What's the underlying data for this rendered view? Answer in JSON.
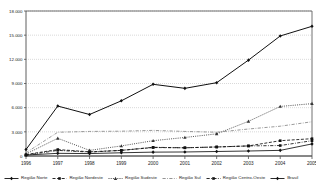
{
  "chart_data": {
    "type": "line",
    "title": "",
    "xlabel": "",
    "ylabel": "",
    "grid": true,
    "legend_position": "bottom",
    "ylim": [
      0,
      18000
    ],
    "yticks": [
      0,
      3000,
      6000,
      9000,
      12000,
      15000,
      18000
    ],
    "ytick_labels": [
      "0",
      "3.000",
      "6.000",
      "9.000",
      "12.000",
      "15.000",
      "18.000"
    ],
    "categories": [
      "1996",
      "1997",
      "1998",
      "1999",
      "2000",
      "2001",
      "2002",
      "2003",
      "2004",
      "2005"
    ],
    "series": [
      {
        "name": "Região Norte",
        "color": "#111111",
        "dash": "solid",
        "marker": "diamond",
        "values": [
          120,
          330,
          300,
          400,
          480,
          500,
          560,
          620,
          700,
          1500
        ]
      },
      {
        "name": "Região Nordeste",
        "color": "#111111",
        "dash": "dashed",
        "marker": "square",
        "values": [
          180,
          800,
          520,
          700,
          1050,
          1020,
          1120,
          1250,
          1900,
          2150
        ]
      },
      {
        "name": "Região Sudeste",
        "color": "#333333",
        "dash": "dotted",
        "marker": "triangle",
        "values": [
          250,
          2200,
          700,
          1250,
          1900,
          2300,
          2750,
          4300,
          6150,
          6500
        ]
      },
      {
        "name": "Região Sul",
        "color": "#888888",
        "dash": "dashdot",
        "marker": "none",
        "values": [
          400,
          2950,
          3050,
          3080,
          3180,
          3050,
          2950,
          3350,
          3700,
          4250
        ]
      },
      {
        "name": "Região Centro-Oeste",
        "color": "#111111",
        "dash": "dashdot",
        "marker": "square",
        "values": [
          100,
          700,
          480,
          700,
          1080,
          1020,
          1120,
          1250,
          1300,
          1900
        ]
      },
      {
        "name": "Brasil",
        "color": "#111111",
        "dash": "solid",
        "marker": "diamond",
        "values": [
          800,
          6200,
          5150,
          6850,
          8900,
          8400,
          9100,
          11900,
          14900,
          16100
        ]
      }
    ]
  },
  "axes": {
    "y_tick_labels": [
      "18.000",
      "15.000",
      "12.000",
      "9.000",
      "6.000",
      "3.000",
      "0"
    ],
    "x_tick_labels": [
      "1996",
      "1997",
      "1998",
      "1999",
      "2000",
      "2001",
      "2002",
      "2003",
      "2004",
      "2005"
    ]
  },
  "legend": {
    "items": [
      {
        "label": "Região Norte"
      },
      {
        "label": "Região Nordeste"
      },
      {
        "label": "Região Sudeste"
      },
      {
        "label": "Região Sul"
      },
      {
        "label": "Região Centro-Oeste"
      },
      {
        "label": "Brasil"
      }
    ]
  },
  "colors": {
    "axis": "#4d4d4d",
    "grid": "#b3b3b3",
    "plot_bg": "#ffffff",
    "text": "#1a1a1a"
  }
}
